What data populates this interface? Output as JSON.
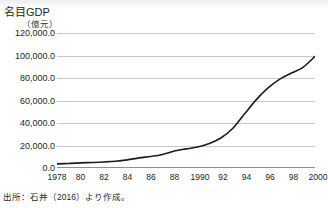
{
  "figure": {
    "source_note": "出所：石井（2016）より作成。",
    "top_band": "scan-band"
  },
  "chart_data": {
    "type": "line",
    "title": "",
    "ylabel": "名目GDP",
    "yunit": "（億元）",
    "xlabel": "",
    "xunit": "（年）",
    "grid": true,
    "legend": "none",
    "ylim": [
      0,
      120000
    ],
    "ytick_values": [
      0,
      20000,
      40000,
      60000,
      80000,
      100000,
      120000
    ],
    "ytick_labels": [
      "0.0",
      "20,000.0",
      "40,000.0",
      "60,000.0",
      "80,000.0",
      "100,000.0",
      "120,000.0"
    ],
    "xlim": [
      1978,
      2000
    ],
    "xtick_values": [
      1978,
      1980,
      1982,
      1984,
      1986,
      1988,
      1990,
      1992,
      1994,
      1996,
      1998,
      2000
    ],
    "xtick_labels": [
      "1978",
      "80",
      "82",
      "84",
      "86",
      "88",
      "1990",
      "92",
      "94",
      "96",
      "98",
      "2000"
    ],
    "line_color": "#1c1c1c",
    "series": [
      {
        "name": "名目GDP",
        "x": [
          1978,
          1979,
          1980,
          1981,
          1982,
          1983,
          1984,
          1985,
          1986,
          1987,
          1988,
          1989,
          1990,
          1991,
          1992,
          1993,
          1994,
          1995,
          1996,
          1997,
          1998,
          1999,
          2000
        ],
        "values": [
          3645,
          4063,
          4546,
          4892,
          5323,
          5963,
          7208,
          9016,
          10275,
          12059,
          15043,
          16992,
          18668,
          21781,
          26923,
          35334,
          48198,
          60794,
          71177,
          78973,
          84402,
          89677,
          99215
        ]
      }
    ]
  }
}
